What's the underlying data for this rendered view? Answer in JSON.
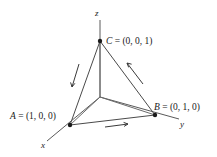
{
  "figure": {
    "background_color": "#ffffff",
    "line_color": "#4a4a4a",
    "label_color": "#1a1a1a"
  },
  "axes": [
    {
      "id": "x",
      "label": "x",
      "label_x": 41,
      "label_y": 148,
      "from": [
        100,
        97
      ],
      "to": [
        47,
        141
      ]
    },
    {
      "id": "y",
      "label": "y",
      "label_x": 180,
      "label_y": 127,
      "from": [
        100,
        97
      ],
      "to": [
        179,
        119
      ]
    },
    {
      "id": "z",
      "label": "z",
      "label_x": 95,
      "label_y": 16,
      "from": [
        100,
        97
      ],
      "to": [
        100,
        20
      ]
    }
  ],
  "points": [
    {
      "id": "A",
      "name": "A",
      "equals": " = ",
      "coords": "(1, 0, 0)",
      "full_label": "A = (1, 0, 0)",
      "cx": 70,
      "cy": 125,
      "label_x": 10,
      "label_y": 119
    },
    {
      "id": "B",
      "name": "B",
      "equals": " = ",
      "coords": "(0, 1, 0)",
      "full_label": "B = (0, 1, 0)",
      "cx": 155,
      "cy": 115,
      "label_x": 154,
      "label_y": 110
    },
    {
      "id": "C",
      "name": "C",
      "equals": " = ",
      "coords": "(0, 0, 1)",
      "full_label": "C = (0, 0, 1)",
      "cx": 100,
      "cy": 41,
      "label_x": 106,
      "label_y": 44
    }
  ],
  "edges": [
    {
      "id": "CA",
      "from": "C",
      "to": "A",
      "path": "M 100 41 L 70 125"
    },
    {
      "id": "AB",
      "from": "A",
      "to": "B",
      "path": "M 70 125 L 155 115"
    },
    {
      "id": "BC",
      "from": "B",
      "to": "C",
      "path": "M 155 115 L 100 41"
    }
  ],
  "spokes": [
    {
      "id": "origin-to-A",
      "path": "M 100 97 L 70 125"
    },
    {
      "id": "origin-to-B",
      "path": "M 100 97 L 155 115"
    },
    {
      "id": "origin-to-C",
      "path": "M 100 97 L 100 41"
    }
  ],
  "direction_arrows": [
    {
      "id": "arrow-CA",
      "along_edge": "CA",
      "direction": "C-to-A",
      "shaft": "M 79 64 L 72 87",
      "head": "M 72 87 L 70.6 82.4 M 72 87 L 74.9 83.3"
    },
    {
      "id": "arrow-BC",
      "along_edge": "BC",
      "direction": "B-to-C",
      "shaft": "M 143 84 L 127 63",
      "head": "M 127 63 L 131.6 64.2 M 127 63 L 128.7 67.4"
    },
    {
      "id": "arrow-AB",
      "along_edge": "AB",
      "direction": "A-to-B",
      "shaft": "M 105 127 L 128 124",
      "head": "M 128 124 L 123.6 122.4 M 128 124 L 124.1 126.4"
    }
  ]
}
